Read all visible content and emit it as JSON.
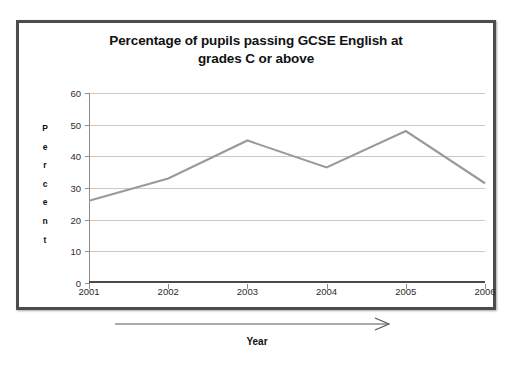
{
  "chart_data": {
    "type": "line",
    "title": "Percentage of pupils passing GCSE English at grades C or above",
    "title_lines": [
      "Percentage of pupils passing GCSE English at",
      "grades C or above"
    ],
    "xlabel": "Year",
    "ylabel": "Percent",
    "ylabel_letters": [
      "P",
      "e",
      "r",
      "c",
      "e",
      "n",
      "t"
    ],
    "categories": [
      "2001",
      "2002",
      "2003",
      "2004",
      "2005",
      "2006"
    ],
    "values": [
      26,
      33,
      45,
      36.5,
      48,
      31.5
    ],
    "series": [
      {
        "name": "Percentage passing GCSE English at grades C or above",
        "values": [
          26,
          33,
          45,
          36.5,
          48,
          31.5
        ]
      }
    ],
    "ylim": [
      0,
      60
    ],
    "yticks": [
      60,
      50,
      40,
      30,
      20,
      10,
      0
    ],
    "ytick_labels": [
      "60",
      "50",
      "40",
      "30",
      "20",
      "10",
      "0"
    ],
    "xtick_labels": [
      "2001",
      "2002",
      "2003",
      "2004",
      "2005",
      "2006"
    ],
    "grid": true,
    "legend": false,
    "legend_position": "none",
    "series_color": "#9a9a9a",
    "gridline_color": "#c9c9c9",
    "axis_color": "#4a4a4a",
    "frame_color": "#4c4c4c",
    "background_color": "#ffffff",
    "annotations": [
      {
        "name": "year-arrow",
        "shape": "arrow-right",
        "label": "Year"
      }
    ]
  }
}
